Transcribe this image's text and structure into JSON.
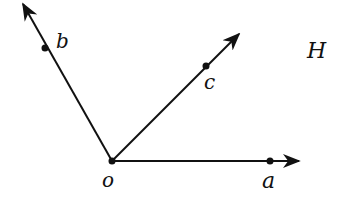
{
  "diagram": {
    "plane_label": "H",
    "origin": {
      "label": "o",
      "x": 112,
      "y": 161
    },
    "rays": [
      {
        "name": "a",
        "label": "a",
        "point": [
          270,
          161
        ],
        "tip": [
          300,
          161
        ]
      },
      {
        "name": "b",
        "label": "b",
        "point": [
          45,
          48
        ],
        "tip": [
          22,
          3
        ]
      },
      {
        "name": "c",
        "label": "c",
        "point": [
          206,
          66
        ],
        "tip": [
          240,
          33
        ]
      }
    ],
    "stroke_color": "#111111",
    "background": "#ffffff"
  }
}
